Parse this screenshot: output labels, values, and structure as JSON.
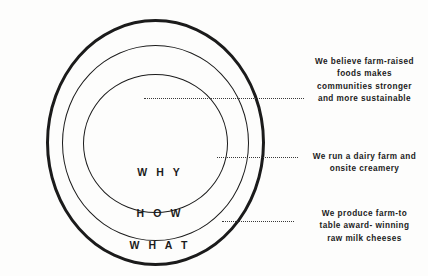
{
  "diagram": {
    "type": "golden-circle",
    "title": "",
    "rings": [
      {
        "id": "why",
        "label": "W H Y",
        "order": 1,
        "position": "inner"
      },
      {
        "id": "how",
        "label": "H O W",
        "order": 2,
        "position": "middle"
      },
      {
        "id": "what",
        "label": "W H A T",
        "order": 3,
        "position": "outer"
      }
    ],
    "annotations": [
      {
        "id": "why-annotation",
        "connects_to": "why",
        "lines": [
          "We believe farm-raised",
          "foods makes",
          "communities stronger",
          "and more sustainable"
        ]
      },
      {
        "id": "how-annotation",
        "connects_to": "how",
        "lines": [
          "We run a dairy farm and",
          "onsite creamery"
        ]
      },
      {
        "id": "what-annotation",
        "connects_to": "what",
        "lines": [
          "We produce farm-to",
          "table award- winning",
          "raw milk cheeses"
        ]
      }
    ],
    "colors": {
      "stroke": "#1b1b1b",
      "text": "#1b1b1b",
      "leader": "#3a3a3a",
      "background": "#fdfdfc"
    }
  }
}
